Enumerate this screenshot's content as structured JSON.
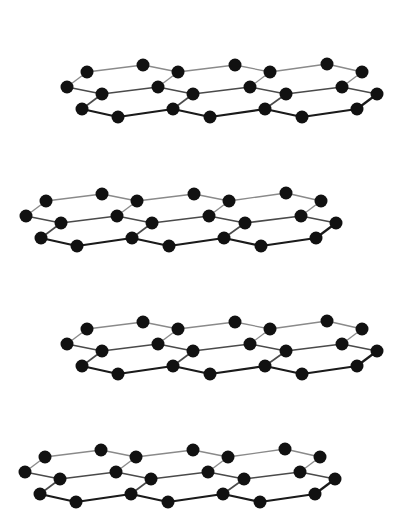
{
  "diagram": {
    "type": "stacked-graphene-layers",
    "background": "#ffffff",
    "atom_color": "#111111",
    "atom_radius": 6.5,
    "bond_colors": {
      "top": "#8a8a8a",
      "middle": "#4a4a4a",
      "bottom": "#1a1a1a"
    },
    "base_layer": {
      "atoms": [
        {
          "id": "a1",
          "x": 87,
          "y": 72,
          "row": "top"
        },
        {
          "id": "a2",
          "x": 143,
          "y": 65,
          "row": "top"
        },
        {
          "id": "a3",
          "x": 178,
          "y": 72,
          "row": "top"
        },
        {
          "id": "a4",
          "x": 235,
          "y": 65,
          "row": "top"
        },
        {
          "id": "a5",
          "x": 270,
          "y": 72,
          "row": "top"
        },
        {
          "id": "a6",
          "x": 327,
          "y": 64,
          "row": "top"
        },
        {
          "id": "a7",
          "x": 362,
          "y": 72,
          "row": "top"
        },
        {
          "id": "b1",
          "x": 67,
          "y": 87,
          "row": "middle"
        },
        {
          "id": "b2",
          "x": 102,
          "y": 94,
          "row": "middle"
        },
        {
          "id": "b3",
          "x": 158,
          "y": 87,
          "row": "middle"
        },
        {
          "id": "b4",
          "x": 193,
          "y": 94,
          "row": "middle"
        },
        {
          "id": "b5",
          "x": 250,
          "y": 87,
          "row": "middle"
        },
        {
          "id": "b6",
          "x": 286,
          "y": 94,
          "row": "middle"
        },
        {
          "id": "b7",
          "x": 342,
          "y": 87,
          "row": "middle"
        },
        {
          "id": "b8",
          "x": 377,
          "y": 94,
          "row": "middle"
        },
        {
          "id": "c1",
          "x": 82,
          "y": 109,
          "row": "bottom"
        },
        {
          "id": "c2",
          "x": 118,
          "y": 117,
          "row": "bottom"
        },
        {
          "id": "c3",
          "x": 173,
          "y": 109,
          "row": "bottom"
        },
        {
          "id": "c4",
          "x": 210,
          "y": 117,
          "row": "bottom"
        },
        {
          "id": "c5",
          "x": 265,
          "y": 109,
          "row": "bottom"
        },
        {
          "id": "c6",
          "x": 302,
          "y": 117,
          "row": "bottom"
        },
        {
          "id": "c7",
          "x": 357,
          "y": 109,
          "row": "bottom"
        }
      ],
      "bonds": [
        [
          "a1",
          "a2",
          "top"
        ],
        [
          "a2",
          "a3",
          "top"
        ],
        [
          "a3",
          "a4",
          "top"
        ],
        [
          "a4",
          "a5",
          "top"
        ],
        [
          "a5",
          "a6",
          "top"
        ],
        [
          "a6",
          "a7",
          "top"
        ],
        [
          "a1",
          "b1",
          "top"
        ],
        [
          "a3",
          "b3",
          "top"
        ],
        [
          "a5",
          "b5",
          "top"
        ],
        [
          "a7",
          "b7",
          "top"
        ],
        [
          "b1",
          "b2",
          "middle"
        ],
        [
          "b2",
          "b3",
          "middle"
        ],
        [
          "b3",
          "b4",
          "middle"
        ],
        [
          "b4",
          "b5",
          "middle"
        ],
        [
          "b5",
          "b6",
          "middle"
        ],
        [
          "b6",
          "b7",
          "middle"
        ],
        [
          "b7",
          "b8",
          "middle"
        ],
        [
          "b2",
          "c1",
          "middle"
        ],
        [
          "b4",
          "c3",
          "middle"
        ],
        [
          "b6",
          "c5",
          "middle"
        ],
        [
          "b8",
          "c7",
          "bottom"
        ],
        [
          "c1",
          "c2",
          "bottom"
        ],
        [
          "c2",
          "c3",
          "bottom"
        ],
        [
          "c3",
          "c4",
          "bottom"
        ],
        [
          "c4",
          "c5",
          "bottom"
        ],
        [
          "c5",
          "c6",
          "bottom"
        ],
        [
          "c6",
          "c7",
          "bottom"
        ]
      ]
    },
    "layers": [
      {
        "name": "layer-1",
        "dx": 0,
        "dy": 0
      },
      {
        "name": "layer-2",
        "dx": -41,
        "dy": 129
      },
      {
        "name": "layer-3",
        "dx": 0,
        "dy": 257
      },
      {
        "name": "layer-4",
        "dx": -42,
        "dy": 385
      }
    ]
  }
}
